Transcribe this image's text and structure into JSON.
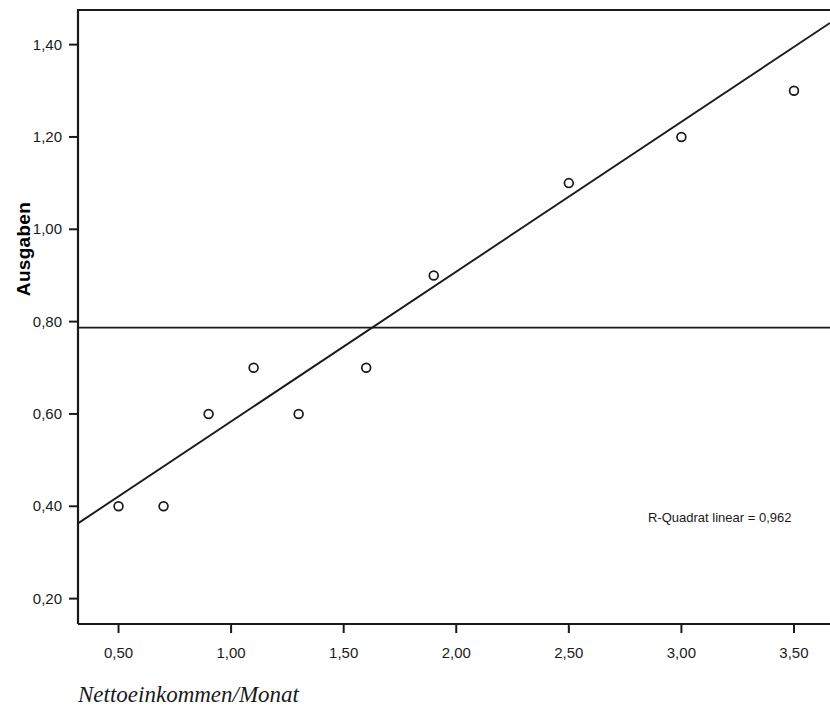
{
  "chart_data": {
    "type": "scatter",
    "title": "",
    "xlabel": "Nettoeinkommen/Monat",
    "ylabel": "Ausgaben",
    "xlim": [
      0.32,
      3.66
    ],
    "ylim": [
      0.145,
      1.475
    ],
    "grid": false,
    "legend": null,
    "x_ticks": [
      "0,50",
      "1,00",
      "1,50",
      "2,00",
      "2,50",
      "3,00",
      "3,50"
    ],
    "x_tick_values": [
      0.5,
      1.0,
      1.5,
      2.0,
      2.5,
      3.0,
      3.5
    ],
    "y_ticks": [
      "0,20",
      "0,40",
      "0,60",
      "0,80",
      "1,00",
      "1,20",
      "1,40"
    ],
    "y_tick_values": [
      0.2,
      0.4,
      0.6,
      0.8,
      1.0,
      1.2,
      1.4
    ],
    "points": [
      {
        "x": 0.5,
        "y": 0.4
      },
      {
        "x": 0.7,
        "y": 0.4
      },
      {
        "x": 0.9,
        "y": 0.6
      },
      {
        "x": 1.1,
        "y": 0.7
      },
      {
        "x": 1.3,
        "y": 0.6
      },
      {
        "x": 1.6,
        "y": 0.7
      },
      {
        "x": 1.9,
        "y": 0.9
      },
      {
        "x": 2.5,
        "y": 1.1
      },
      {
        "x": 3.0,
        "y": 1.2
      },
      {
        "x": 3.5,
        "y": 1.3
      }
    ],
    "fit_line": {
      "name": "linear fit",
      "x_start": 0.32,
      "y_start": 0.363,
      "x_end": 3.66,
      "y_end": 1.447
    },
    "reference_line": {
      "name": "horizontal reference",
      "orientation": "horizontal",
      "y": 0.787
    },
    "annotations": [
      {
        "name": "r-square",
        "text": "R-Quadrat linear = 0,962",
        "x": 3.04,
        "y": 0.345
      }
    ]
  },
  "annotation": {
    "r_square_text": "R-Quadrat linear = 0,962"
  },
  "axes": {
    "y_title": "Ausgaben",
    "x_caption": "Nettoeinkommen/Monat"
  }
}
